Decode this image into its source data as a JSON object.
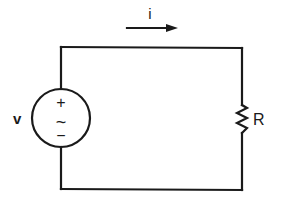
{
  "diagram": {
    "type": "circuit",
    "current": {
      "label": "i",
      "direction": "right"
    },
    "source": {
      "label": "v",
      "plus_sign": "+",
      "minus_sign": "−",
      "ac_symbol": "~",
      "kind": "ac-voltage-source"
    },
    "resistor": {
      "label": "R"
    },
    "colors": {
      "line": "#1a1a1a",
      "background": "#ffffff"
    }
  }
}
